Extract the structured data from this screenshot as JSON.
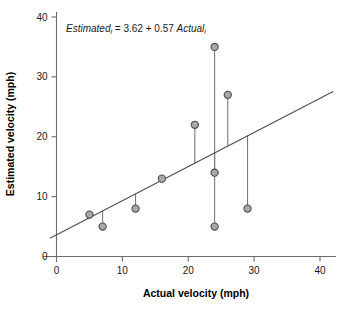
{
  "chart_data": {
    "type": "scatter",
    "title": "",
    "annotation": {
      "prefix_italic": "Estimated",
      "prefix_sub": "i",
      "middle": " = 3.62 + 0.57 ",
      "suffix_italic": "Actual",
      "suffix_sub": "i",
      "full_text": "Estimatedi = 3.62 + 0.57 Actuali",
      "intercept": 3.62,
      "slope": 0.57
    },
    "xlabel": "Actual velocity (mph)",
    "ylabel": "Estimated velocity (mph)",
    "xlim": [
      -2,
      42
    ],
    "ylim": [
      -2,
      41
    ],
    "xticks": [
      0,
      10,
      20,
      30,
      40
    ],
    "yticks": [
      0,
      10,
      20,
      30,
      40
    ],
    "xtick_labels": [
      "0",
      "10",
      "20",
      "30",
      "40"
    ],
    "ytick_labels": [
      "0",
      "10",
      "20",
      "30",
      "40"
    ],
    "grid": false,
    "legend": "none",
    "marker_fill": "#a8a8a8",
    "marker_edge": "#4a4a4a",
    "line_color": "#4d4d4d",
    "residual_color": "#7a7a7a",
    "points": [
      {
        "x": 5,
        "y": 7
      },
      {
        "x": 7,
        "y": 5
      },
      {
        "x": 12,
        "y": 8
      },
      {
        "x": 16,
        "y": 13
      },
      {
        "x": 21,
        "y": 22
      },
      {
        "x": 24,
        "y": 35
      },
      {
        "x": 24,
        "y": 14
      },
      {
        "x": 24,
        "y": 5
      },
      {
        "x": 26,
        "y": 27
      },
      {
        "x": 29,
        "y": 8
      }
    ],
    "fit_line": {
      "x0": -1.0,
      "y0": 3.05,
      "x1": 42.0,
      "y1": 27.56
    },
    "residual_segments": [
      {
        "x": 5,
        "y_point": 7,
        "y_fit": 6.47
      },
      {
        "x": 7,
        "y_point": 5,
        "y_fit": 7.61
      },
      {
        "x": 12,
        "y_point": 8,
        "y_fit": 10.46
      },
      {
        "x": 16,
        "y_point": 13,
        "y_fit": 12.74
      },
      {
        "x": 21,
        "y_point": 22,
        "y_fit": 15.59
      },
      {
        "x": 24,
        "y_point": 35,
        "y_fit": 17.3
      },
      {
        "x": 24,
        "y_point": 14,
        "y_fit": 17.3
      },
      {
        "x": 24,
        "y_point": 5,
        "y_fit": 17.3
      },
      {
        "x": 26,
        "y_point": 27,
        "y_fit": 18.44
      },
      {
        "x": 29,
        "y_point": 8,
        "y_fit": 20.15
      }
    ]
  }
}
